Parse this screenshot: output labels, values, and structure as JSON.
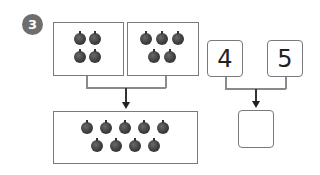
{
  "problem": {
    "number": "3",
    "group_a": {
      "apple_count": 4,
      "rows": [
        2,
        2
      ]
    },
    "group_b": {
      "apple_count": 5,
      "rows": [
        3,
        2
      ]
    },
    "combined": {
      "apple_count": 9,
      "rows": [
        5,
        4
      ]
    },
    "addend_1": "4",
    "addend_2": "5",
    "answer": ""
  },
  "colors": {
    "badge": "#6e6e6e",
    "apple": "#3e3e3e",
    "border": "#7a7a7a"
  }
}
